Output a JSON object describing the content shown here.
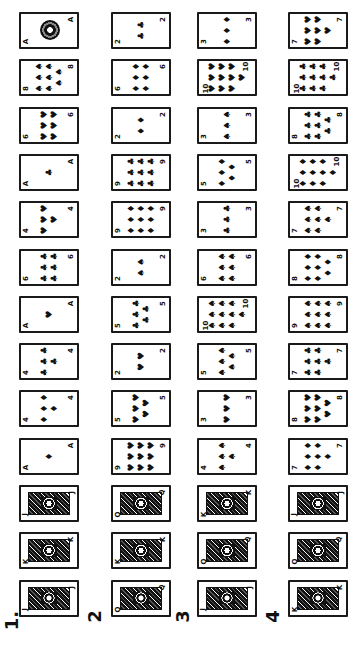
{
  "rows": [
    {
      "label": "1.",
      "cards": [
        {
          "rank": "A",
          "suit": "♠",
          "face": false,
          "ornate": true
        },
        {
          "rank": "8",
          "suit": "♠",
          "face": false
        },
        {
          "rank": "6",
          "suit": "♥",
          "face": false
        },
        {
          "rank": "A",
          "suit": "♣",
          "face": false
        },
        {
          "rank": "4",
          "suit": "♥",
          "face": false
        },
        {
          "rank": "6",
          "suit": "♣",
          "face": false
        },
        {
          "rank": "A",
          "suit": "♥",
          "face": false
        },
        {
          "rank": "4",
          "suit": "♣",
          "face": false
        },
        {
          "rank": "4",
          "suit": "♦",
          "face": false
        },
        {
          "rank": "A",
          "suit": "♦",
          "face": false
        },
        {
          "rank": "J",
          "suit": "♥",
          "face": true
        },
        {
          "rank": "K",
          "suit": "♠",
          "face": true
        },
        {
          "rank": "J",
          "suit": "♦",
          "face": true
        }
      ]
    },
    {
      "label": "2",
      "cards": [
        {
          "rank": "2",
          "suit": "♣",
          "face": false
        },
        {
          "rank": "6",
          "suit": "♦",
          "face": false
        },
        {
          "rank": "2",
          "suit": "♦",
          "face": false
        },
        {
          "rank": "9",
          "suit": "♣",
          "face": false
        },
        {
          "rank": "9",
          "suit": "♦",
          "face": false
        },
        {
          "rank": "2",
          "suit": "♠",
          "face": false
        },
        {
          "rank": "5",
          "suit": "♣",
          "face": false
        },
        {
          "rank": "2",
          "suit": "♥",
          "face": false
        },
        {
          "rank": "5",
          "suit": "♥",
          "face": false
        },
        {
          "rank": "9",
          "suit": "♥",
          "face": false
        },
        {
          "rank": "Q",
          "suit": "♠",
          "face": true
        },
        {
          "rank": "K",
          "suit": "♦",
          "face": true
        },
        {
          "rank": "Q",
          "suit": "♦",
          "face": true
        }
      ]
    },
    {
      "label": "3",
      "cards": [
        {
          "rank": "3",
          "suit": "♦",
          "face": false
        },
        {
          "rank": "10",
          "suit": "♥",
          "face": false
        },
        {
          "rank": "3",
          "suit": "♠",
          "face": false
        },
        {
          "rank": "5",
          "suit": "♦",
          "face": false
        },
        {
          "rank": "3",
          "suit": "♣",
          "face": false
        },
        {
          "rank": "6",
          "suit": "♠",
          "face": false
        },
        {
          "rank": "10",
          "suit": "♠",
          "face": false
        },
        {
          "rank": "5",
          "suit": "♠",
          "face": false
        },
        {
          "rank": "3",
          "suit": "♥",
          "face": false
        },
        {
          "rank": "4",
          "suit": "♠",
          "face": false
        },
        {
          "rank": "K",
          "suit": "♥",
          "face": true
        },
        {
          "rank": "Q",
          "suit": "♣",
          "face": true
        },
        {
          "rank": "J",
          "suit": "♠",
          "face": true
        }
      ]
    },
    {
      "label": "4",
      "cards": [
        {
          "rank": "7",
          "suit": "♥",
          "face": false
        },
        {
          "rank": "10",
          "suit": "♣",
          "face": false
        },
        {
          "rank": "8",
          "suit": "♣",
          "face": false
        },
        {
          "rank": "10",
          "suit": "♦",
          "face": false
        },
        {
          "rank": "7",
          "suit": "♠",
          "face": false
        },
        {
          "rank": "8",
          "suit": "♦",
          "face": false
        },
        {
          "rank": "9",
          "suit": "♠",
          "face": false
        },
        {
          "rank": "7",
          "suit": "♣",
          "face": false
        },
        {
          "rank": "8",
          "suit": "♥",
          "face": false
        },
        {
          "rank": "7",
          "suit": "♦",
          "face": false
        },
        {
          "rank": "J",
          "suit": "♣",
          "face": true
        },
        {
          "rank": "Q",
          "suit": "♥",
          "face": true
        },
        {
          "rank": "K",
          "suit": "♣",
          "face": true
        }
      ]
    }
  ]
}
